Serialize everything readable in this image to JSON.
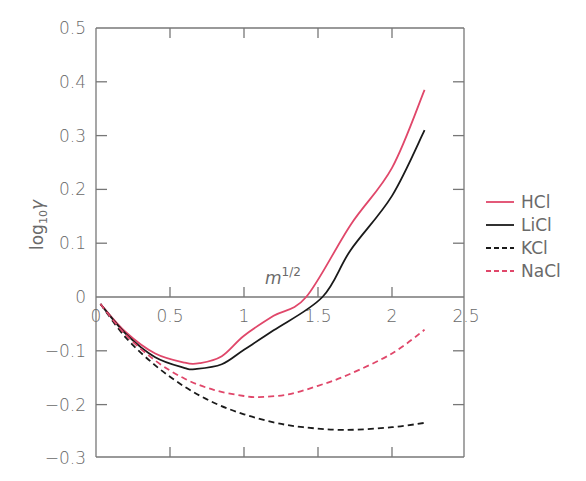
{
  "chart_data": {
    "type": "line",
    "title": "",
    "xlabel": "m^1/2",
    "ylabel": "log10 γ",
    "xlim": [
      0,
      2.5
    ],
    "ylim": [
      -0.3,
      0.5
    ],
    "x_ticks": [
      "0",
      "0.5",
      "1",
      "1.5",
      "2",
      "2.5"
    ],
    "y_ticks": [
      "0.5",
      "0.4",
      "0.3",
      "0.2",
      "0.1",
      "0",
      "-0.1",
      "-0.2",
      "-0.3"
    ],
    "grid": false,
    "legend_position": "right",
    "series": [
      {
        "name": "HCl",
        "color": "#e0476a",
        "style": "solid",
        "x": [
          0.03,
          0.2,
          0.4,
          0.6,
          0.7,
          0.85,
          1.0,
          1.2,
          1.42,
          1.72,
          2.0,
          2.22
        ],
        "y": [
          -0.013,
          -0.065,
          -0.105,
          -0.122,
          -0.123,
          -0.11,
          -0.072,
          -0.035,
          0.0,
          0.134,
          0.24,
          0.385
        ]
      },
      {
        "name": "LiCl",
        "color": "#1a1a1a",
        "style": "solid",
        "x": [
          0.03,
          0.2,
          0.4,
          0.6,
          0.67,
          0.85,
          1.0,
          1.2,
          1.53,
          1.72,
          2.0,
          2.22
        ],
        "y": [
          -0.013,
          -0.068,
          -0.112,
          -0.132,
          -0.134,
          -0.125,
          -0.098,
          -0.062,
          0.0,
          0.087,
          0.188,
          0.31
        ]
      },
      {
        "name": "KCl",
        "color": "#1a1a1a",
        "style": "dashed",
        "x": [
          0.03,
          0.2,
          0.4,
          0.6,
          0.8,
          1.0,
          1.2,
          1.4,
          1.68,
          2.0,
          2.22
        ],
        "y": [
          -0.013,
          -0.075,
          -0.127,
          -0.167,
          -0.197,
          -0.218,
          -0.233,
          -0.242,
          -0.247,
          -0.242,
          -0.234
        ]
      },
      {
        "name": "NaCl",
        "color": "#e0476a",
        "style": "dashed",
        "x": [
          0.03,
          0.2,
          0.4,
          0.6,
          0.8,
          1.0,
          1.1,
          1.3,
          1.5,
          1.7,
          2.0,
          2.22
        ],
        "y": [
          -0.013,
          -0.07,
          -0.118,
          -0.152,
          -0.173,
          -0.184,
          -0.186,
          -0.181,
          -0.165,
          -0.145,
          -0.105,
          -0.061
        ]
      }
    ]
  },
  "legend": {
    "items": [
      {
        "label": "HCl"
      },
      {
        "label": "LiCl"
      },
      {
        "label": "KCl"
      },
      {
        "label": "NaCl"
      }
    ]
  },
  "axes": {
    "xlabel_base": "m",
    "xlabel_sup": "1/2",
    "ylabel_base": "log",
    "ylabel_sub": "10",
    "ylabel_var": "γ"
  }
}
